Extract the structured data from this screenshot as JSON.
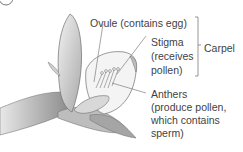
{
  "figure": {
    "step_marker": "",
    "labels": {
      "ovule": "Ovule (contains egg)",
      "stigma_line1": "Stigma",
      "stigma_line2": "(receives",
      "stigma_line3": "pollen)",
      "carpel": "Carpel",
      "anthers_line1": "Anthers",
      "anthers_line2": "(produce pollen,",
      "anthers_line3": "which contains",
      "anthers_line4": "sperm)"
    }
  }
}
